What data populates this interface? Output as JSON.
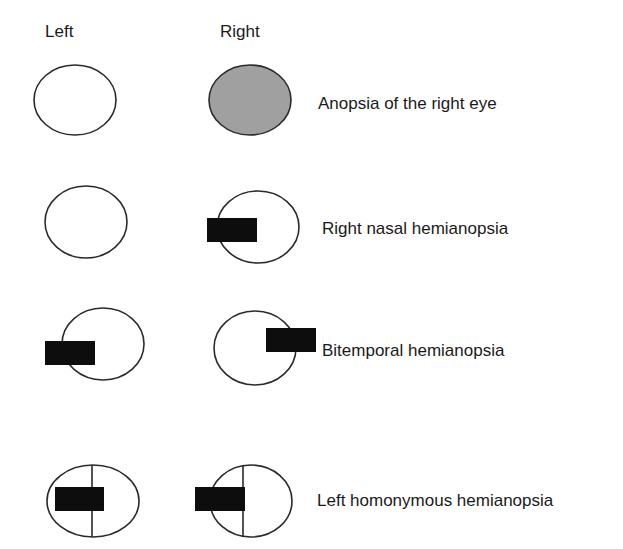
{
  "headers": {
    "left": "Left",
    "right": "Right"
  },
  "colors": {
    "outline": "#2a2a2a",
    "defect": "#0d0d0d",
    "blind_fill": "#a0a0a0",
    "text": "#1a1a1a"
  },
  "rows": [
    {
      "label": "Anopsia of the right eye",
      "left_eye": "normal visual field",
      "right_eye": "complete field loss (shaded)"
    },
    {
      "label": "Right nasal hemianopsia",
      "left_eye": "normal visual field",
      "right_eye": "defect on nasal (left) side"
    },
    {
      "label": "Bitemporal hemianopsia",
      "left_eye": "defect on temporal (left) side",
      "right_eye": "defect on temporal (right) side"
    },
    {
      "label": "Left homonymous hemianopsia",
      "left_eye": "vertical midline, defect on left half",
      "right_eye": "vertical midline, defect on left half"
    }
  ]
}
